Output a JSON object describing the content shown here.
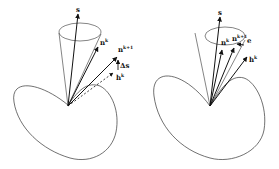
{
  "figures": [
    {
      "id": "left",
      "labels": {
        "s": "s",
        "n_k": "n",
        "n_k_sup": "k",
        "n_k1": "n",
        "n_k1_sup": "k+1",
        "delta_s": "Δs",
        "h_k": "h",
        "h_k_sup": "k"
      }
    },
    {
      "id": "right",
      "labels": {
        "s": "s",
        "n_k": "n",
        "n_k_sup": "k",
        "n_k1": "n",
        "n_k1_sup": "k+1",
        "e": "e",
        "h_k": "h",
        "h_k_sup": "k"
      }
    }
  ],
  "colors": {
    "stroke": "#222222",
    "background": "#ffffff"
  }
}
